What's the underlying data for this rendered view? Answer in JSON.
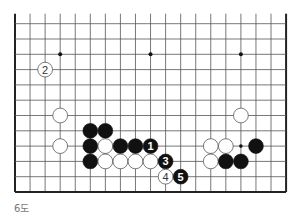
{
  "caption": "6도",
  "board": {
    "origin_x": 15,
    "origin_y": 23.7,
    "spacing_x": 15.06,
    "spacing_y": 15.3,
    "cols": 19,
    "rows": 12,
    "top_open": true,
    "edges": {
      "left": true,
      "right": true,
      "bottom": true,
      "top": false
    },
    "stone_radius": 7.4,
    "colors": {
      "line": "#555555",
      "edge": "#222222",
      "black": "#111111",
      "white": "#ffffff",
      "white_outline": "#444444"
    },
    "star_points": [
      [
        3,
        2
      ],
      [
        9,
        2
      ],
      [
        15,
        2
      ]
    ],
    "marks": [
      [
        15,
        8
      ]
    ],
    "stones": [
      {
        "c": 3,
        "r": 6,
        "color": "white"
      },
      {
        "c": 3,
        "r": 8,
        "color": "white"
      },
      {
        "c": 5,
        "r": 7,
        "color": "black"
      },
      {
        "c": 6,
        "r": 7,
        "color": "black"
      },
      {
        "c": 5,
        "r": 8,
        "color": "black"
      },
      {
        "c": 6,
        "r": 8,
        "color": "white"
      },
      {
        "c": 7,
        "r": 8,
        "color": "black"
      },
      {
        "c": 8,
        "r": 8,
        "color": "black"
      },
      {
        "c": 9,
        "r": 8,
        "color": "black",
        "label": "1"
      },
      {
        "c": 5,
        "r": 9,
        "color": "black"
      },
      {
        "c": 6,
        "r": 9,
        "color": "white"
      },
      {
        "c": 7,
        "r": 9,
        "color": "white"
      },
      {
        "c": 8,
        "r": 9,
        "color": "white"
      },
      {
        "c": 9,
        "r": 9,
        "color": "white"
      },
      {
        "c": 10,
        "r": 9,
        "color": "black",
        "label": "3"
      },
      {
        "c": 10,
        "r": 10,
        "color": "white",
        "label": "4"
      },
      {
        "c": 11,
        "r": 10,
        "color": "black",
        "label": "5"
      },
      {
        "c": 2,
        "r": 3,
        "color": "white",
        "label": "2"
      },
      {
        "c": 15,
        "r": 6,
        "color": "white"
      },
      {
        "c": 13,
        "r": 8,
        "color": "white"
      },
      {
        "c": 14,
        "r": 8,
        "color": "white"
      },
      {
        "c": 16,
        "r": 8,
        "color": "black"
      },
      {
        "c": 13,
        "r": 9,
        "color": "white"
      },
      {
        "c": 14,
        "r": 9,
        "color": "black"
      },
      {
        "c": 15,
        "r": 9,
        "color": "black"
      }
    ]
  }
}
